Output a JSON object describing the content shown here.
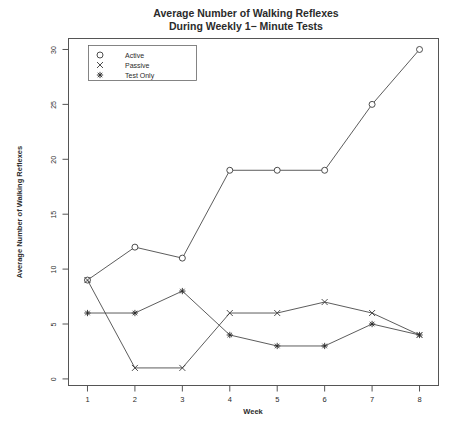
{
  "chart_data": {
    "type": "line",
    "title": "Average Number of Walking Reflexes",
    "subtitle": "During Weekly 1− Minute Tests",
    "xlabel": "Week",
    "ylabel": "Average Number of Walking Reflexes",
    "x": [
      1,
      2,
      3,
      4,
      5,
      6,
      7,
      8
    ],
    "categories": [
      "1",
      "2",
      "3",
      "4",
      "5",
      "6",
      "7",
      "8"
    ],
    "xlim": [
      0.6,
      8.4
    ],
    "ylim": [
      -0.6,
      31.0
    ],
    "xticks": [
      1,
      2,
      3,
      4,
      5,
      6,
      7,
      8
    ],
    "xtick_labels": [
      "1",
      "2",
      "3",
      "4",
      "5",
      "6",
      "7",
      "8"
    ],
    "yticks": [
      0,
      5,
      10,
      15,
      20,
      25,
      30
    ],
    "ytick_labels": [
      "0",
      "5",
      "10",
      "15",
      "20",
      "25",
      "30"
    ],
    "grid": false,
    "legend_position": "top-left",
    "series": [
      {
        "name": "Active",
        "marker": "circle",
        "values": [
          9,
          12,
          11,
          19,
          19,
          19,
          25,
          30
        ]
      },
      {
        "name": "Passive",
        "marker": "cross",
        "values": [
          9,
          1,
          1,
          6,
          6,
          7,
          6,
          4
        ]
      },
      {
        "name": "Test Only",
        "marker": "star",
        "values": [
          6,
          6,
          8,
          4,
          3,
          3,
          5,
          4
        ]
      }
    ],
    "legend_entries": [
      {
        "label": "Active",
        "marker": "circle"
      },
      {
        "label": "Passive",
        "marker": "cross"
      },
      {
        "label": "Test Only",
        "marker": "star"
      }
    ],
    "colors": {
      "line": "#4a4a4a",
      "marker_stroke": "#3a3a3a",
      "marker_fill": "#ffffff",
      "axis": "#555555",
      "text": "#2b2b2b",
      "background": "#ffffff"
    }
  }
}
